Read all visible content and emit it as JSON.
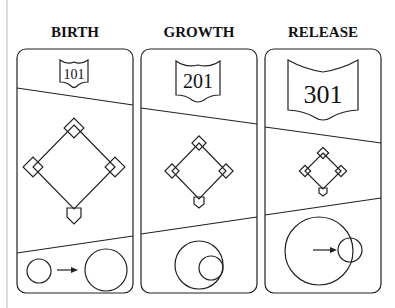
{
  "diagram": {
    "type": "staged-comparison",
    "colors": {
      "line": "#222222",
      "background": "#ffffff",
      "text": "#111111"
    },
    "stages": [
      {
        "title": "BIRTH",
        "tag": "101"
      },
      {
        "title": "GROWTH",
        "tag": "201"
      },
      {
        "title": "RELEASE",
        "tag": "301"
      }
    ]
  }
}
